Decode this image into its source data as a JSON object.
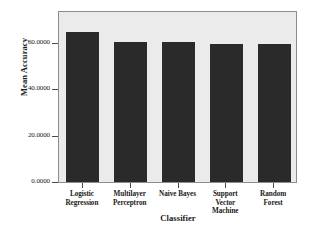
{
  "chart_data": {
    "type": "bar",
    "title": "",
    "subtitle": "",
    "xlabel": "Classifier",
    "ylabel": "Mean Accuracy",
    "categories": [
      "Logistic\nRegression",
      "Multilayer\nPerceptron",
      "Naive Bayes",
      "Support\nVector\nMachine",
      "Random\nForest"
    ],
    "values": [
      64.8,
      60.4,
      60.3,
      59.6,
      59.6
    ],
    "ylim": [
      0,
      74.2
    ],
    "yticks": [
      0,
      20,
      40,
      60
    ],
    "ytick_labels": [
      "0.0000",
      "20.0000",
      "40.0000",
      "60.0000"
    ],
    "grid": false,
    "legend": null,
    "bar_color": "#2a2a2a",
    "plot_background": "#ebebeb",
    "frame_color": "#8c8c8c",
    "page_background": "#ffffff"
  },
  "axes": {
    "y_title": "Mean Accuracy",
    "x_title": "Classifier"
  },
  "categories": [
    {
      "label_lines": [
        "Logistic",
        "Regression"
      ]
    },
    {
      "label_lines": [
        "Multilayer",
        "Perceptron"
      ]
    },
    {
      "label_lines": [
        "Naive Bayes"
      ]
    },
    {
      "label_lines": [
        "Support",
        "Vector",
        "Machine"
      ]
    },
    {
      "label_lines": [
        "Random",
        "Forest"
      ]
    }
  ],
  "ytick_labels": [
    "60.0000",
    "40.0000",
    "20.0000",
    "0.0000"
  ]
}
